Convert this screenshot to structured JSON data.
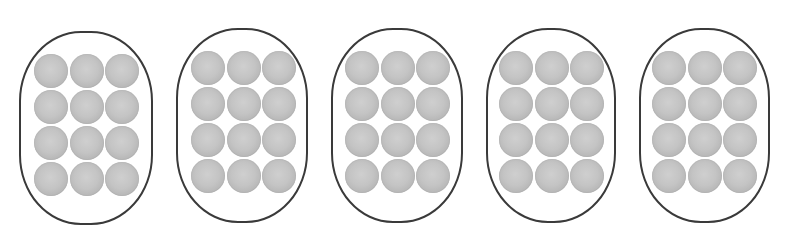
{
  "diagram": {
    "description": "Five groups of 12 balls each",
    "group_count": 5,
    "balls_per_group": 12,
    "grid": {
      "columns": 3,
      "rows": 4
    },
    "colors": {
      "outline": "#3a3a3a",
      "ball_light": "#cfcfcf",
      "ball_mid": "#c4c4c4",
      "ball_dark": "#9c9c9c",
      "background": "#ffffff"
    },
    "groups": [
      {
        "id": 1,
        "balls": 12,
        "box": {
          "left": 19,
          "top": 31,
          "width": 134,
          "height": 194
        },
        "grid_offset": {
          "left": 13,
          "top": 21
        }
      },
      {
        "id": 2,
        "balls": 12,
        "box": {
          "left": 176,
          "top": 28,
          "width": 132,
          "height": 195
        },
        "grid_offset": {
          "left": 13,
          "top": 21
        }
      },
      {
        "id": 3,
        "balls": 12,
        "box": {
          "left": 331,
          "top": 28,
          "width": 132,
          "height": 195
        },
        "grid_offset": {
          "left": 12,
          "top": 21
        }
      },
      {
        "id": 4,
        "balls": 12,
        "box": {
          "left": 486,
          "top": 28,
          "width": 130,
          "height": 195
        },
        "grid_offset": {
          "left": 11,
          "top": 21
        }
      },
      {
        "id": 5,
        "balls": 12,
        "box": {
          "left": 639,
          "top": 28,
          "width": 131,
          "height": 195
        },
        "grid_offset": {
          "left": 11,
          "top": 21
        }
      }
    ]
  }
}
